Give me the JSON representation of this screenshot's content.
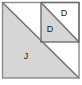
{
  "figure": {
    "name": "dissected-square-diagram",
    "type": "geometric-dissection",
    "colors": {
      "shaded_fill": "#d6d6d6",
      "unshaded_fill": "#ffffff",
      "stroke": "#6e6e6e",
      "outer_border": "#8a8a8a",
      "label_text": "#1a1a1a",
      "page_background": "#ffffff"
    },
    "outer_square": {
      "name": "outer-square",
      "x": 2.5,
      "y": 2.5,
      "width": 76.5,
      "height": 75.5
    },
    "main_diagonal": {
      "name": "main-diagonal",
      "from": [
        2.5,
        2.5
      ],
      "to": [
        79,
        78
      ]
    },
    "inner_square": {
      "name": "inner-square",
      "x": 41,
      "y": 2.5,
      "width": 38,
      "height": 39.5
    },
    "inner_diagonal": {
      "name": "inner-diagonal",
      "from": [
        41,
        2.5
      ],
      "to": [
        79,
        42
      ]
    },
    "regions": [
      {
        "name": "region-j-large-triangle",
        "label": "J",
        "shaded": true,
        "points": "2.5,2.5 2.5,78 79,78",
        "label_x": 26,
        "label_y": 57
      },
      {
        "name": "region-d-inner-lower-left",
        "label": "D",
        "shaded": true,
        "points": "41,2.5 41,42 79,42",
        "label_x": 50,
        "label_y": 30
      },
      {
        "name": "region-d-inner-upper-right",
        "label": "D",
        "shaded": false,
        "points": "41,2.5 79,2.5 79,42",
        "label_x": 64,
        "label_y": 14
      }
    ],
    "labels": [
      {
        "name": "label-j",
        "text": "J",
        "x": 26,
        "y": 57
      },
      {
        "name": "label-d-inner",
        "text": "D",
        "x": 50,
        "y": 30
      },
      {
        "name": "label-d-outer",
        "text": "D",
        "x": 64,
        "y": 14
      }
    ]
  }
}
